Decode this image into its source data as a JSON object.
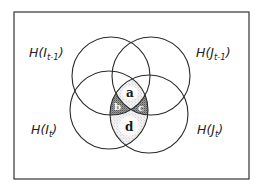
{
  "diagram": {
    "title": "",
    "type": "venn-4-circle",
    "frame": {
      "x": 14,
      "y": 12,
      "width": 235,
      "height": 167,
      "stroke": "#333333"
    },
    "circles": [
      {
        "id": "I_prev",
        "label_main": "H(I",
        "label_sub": "t-1",
        "label_close": ")",
        "cx": 111,
        "cy": 76,
        "r": 39
      },
      {
        "id": "J_prev",
        "label_main": "H(J",
        "label_sub": "t-1",
        "label_close": ")",
        "cx": 151,
        "cy": 76,
        "r": 39
      },
      {
        "id": "I_curr",
        "label_main": "H(I",
        "label_sub": "t",
        "label_close": ")",
        "cx": 109,
        "cy": 110,
        "r": 39
      },
      {
        "id": "J_curr",
        "label_main": "H(J",
        "label_sub": "t",
        "label_close": ")",
        "cx": 149,
        "cy": 114,
        "r": 39
      }
    ],
    "regions": [
      {
        "id": "a",
        "label": "a",
        "shading": "light-stipple",
        "definition": "H(I_{t-1}) ∩ H(J_{t-1}) ∩ H(I_t) ∩ H(J_t)"
      },
      {
        "id": "b",
        "label": "b",
        "shading": "dark-stipple",
        "definition": "H(I_{t-1}) ∩ H(I_t) ∩ H(J_t) \\ H(J_{t-1})"
      },
      {
        "id": "c",
        "label": "c",
        "shading": "dark-stipple",
        "definition": "H(J_{t-1}) ∩ H(I_t) ∩ H(J_t) \\ H(I_{t-1})"
      },
      {
        "id": "d",
        "label": "d",
        "shading": "light-stipple",
        "definition": "H(I_t) ∩ H(J_t) \\ (H(I_{t-1}) ∪ H(J_{t-1}))"
      }
    ],
    "colors": {
      "stroke": "#2a2a2a",
      "light_stipple": "#d9d9d9",
      "dark_stipple": "#8a8a8a",
      "background": "#ffffff"
    }
  }
}
